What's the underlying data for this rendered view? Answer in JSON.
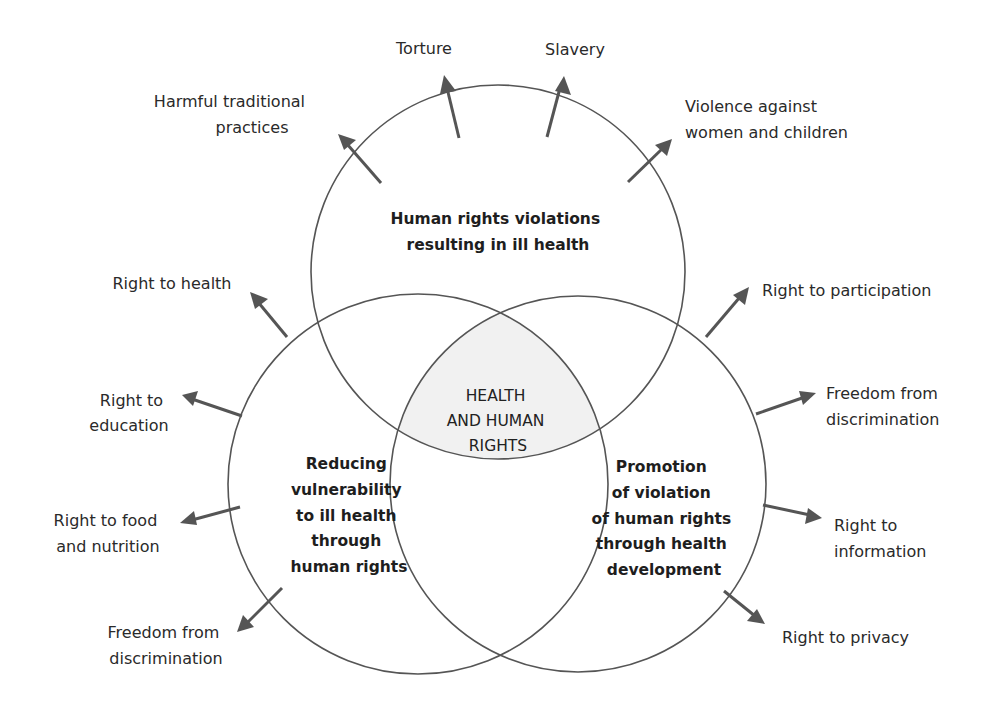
{
  "diagram": {
    "type": "venn-with-radiating-arrows",
    "center": {
      "lines": [
        "HEALTH",
        "AND HUMAN",
        "RIGHTS"
      ],
      "fill": "#f1f1f1"
    },
    "circles": [
      {
        "id": "top",
        "lines": [
          "Human rights violations",
          "resulting in ill health"
        ],
        "arrows": [
          {
            "lines": [
              "Harmful traditional",
              "practices"
            ]
          },
          {
            "lines": [
              "Torture"
            ]
          },
          {
            "lines": [
              "Slavery"
            ]
          },
          {
            "lines": [
              "Violence against",
              "women and children"
            ]
          }
        ]
      },
      {
        "id": "left",
        "lines": [
          "Reducing",
          "vulnerability",
          "to ill health",
          "through",
          "human rights"
        ],
        "arrows": [
          {
            "lines": [
              "Right to health"
            ]
          },
          {
            "lines": [
              "Right to",
              "education"
            ]
          },
          {
            "lines": [
              "Right to food",
              "and nutrition"
            ]
          },
          {
            "lines": [
              "Freedom from",
              "discrimination"
            ]
          }
        ]
      },
      {
        "id": "right",
        "lines": [
          "Promotion",
          "of violation",
          "of human rights",
          "through health",
          "development"
        ],
        "arrows": [
          {
            "lines": [
              "Right to participation"
            ]
          },
          {
            "lines": [
              "Freedom from",
              "discrimination"
            ]
          },
          {
            "lines": [
              "Right to",
              "information"
            ]
          },
          {
            "lines": [
              "Right to privacy"
            ]
          }
        ]
      }
    ],
    "colors": {
      "stroke": "#555555",
      "text": "#2a2a2a",
      "center_fill": "#f1f1f1"
    }
  }
}
